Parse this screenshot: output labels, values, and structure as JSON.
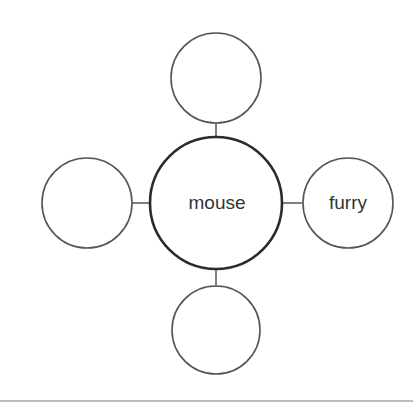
{
  "diagram": {
    "type": "concept-web",
    "center": {
      "label": "mouse",
      "cx": 216,
      "cy": 203,
      "r": 66,
      "stroke_width": 2.6
    },
    "satellites": [
      {
        "position": "top",
        "label": "",
        "cx": 216,
        "cy": 78,
        "r": 45
      },
      {
        "position": "left",
        "label": "",
        "cx": 87,
        "cy": 203,
        "r": 45
      },
      {
        "position": "right",
        "label": "furry",
        "cx": 348,
        "cy": 203,
        "r": 45
      },
      {
        "position": "bottom",
        "label": "",
        "cx": 216,
        "cy": 330,
        "r": 44
      }
    ],
    "connectors": [
      {
        "from": "top",
        "x1": 216,
        "y1": 123,
        "x2": 216,
        "y2": 137
      },
      {
        "from": "left",
        "x1": 132,
        "y1": 203,
        "x2": 150,
        "y2": 203
      },
      {
        "from": "right",
        "x1": 282,
        "y1": 203,
        "x2": 303,
        "y2": 203
      },
      {
        "from": "bottom",
        "x1": 216,
        "y1": 269,
        "x2": 216,
        "y2": 286
      }
    ],
    "colors": {
      "center_stroke": "#2b2b2b",
      "satellite_stroke": "#555555",
      "connector": "#555555",
      "text": "#333333",
      "background": "#ffffff"
    }
  }
}
